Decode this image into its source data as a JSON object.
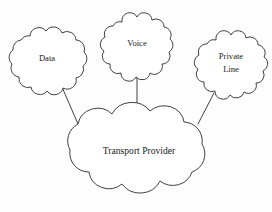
{
  "diagram": {
    "background_color": "#fdfdfd",
    "stroke_color": "#2b2b2b",
    "text_color": "#1a1a1a",
    "nodes": [
      {
        "id": "data",
        "label": "Data",
        "shape": "cloud",
        "center": {
          "x": 47,
          "y": 60
        },
        "radius": {
          "x": 37,
          "y": 33
        }
      },
      {
        "id": "voice",
        "label": "Voice",
        "shape": "cloud",
        "center": {
          "x": 137,
          "y": 46
        },
        "radius": {
          "x": 33,
          "y": 32
        }
      },
      {
        "id": "private_line",
        "label_line1": "Private",
        "label_line2": "Line",
        "shape": "cloud",
        "center": {
          "x": 231,
          "y": 64
        },
        "radius": {
          "x": 33,
          "y": 33
        }
      },
      {
        "id": "transport_provider",
        "label": "Transport Provider",
        "shape": "cloud",
        "center": {
          "x": 139,
          "y": 153
        },
        "radius": {
          "x": 76,
          "y": 45
        }
      }
    ],
    "edges": [
      {
        "id": "data-to-transport",
        "from": "data",
        "to": "transport_provider"
      },
      {
        "id": "voice-to-transport",
        "from": "voice",
        "to": "transport_provider"
      },
      {
        "id": "private-line-to-transport",
        "from": "private_line",
        "to": "transport_provider"
      }
    ]
  }
}
